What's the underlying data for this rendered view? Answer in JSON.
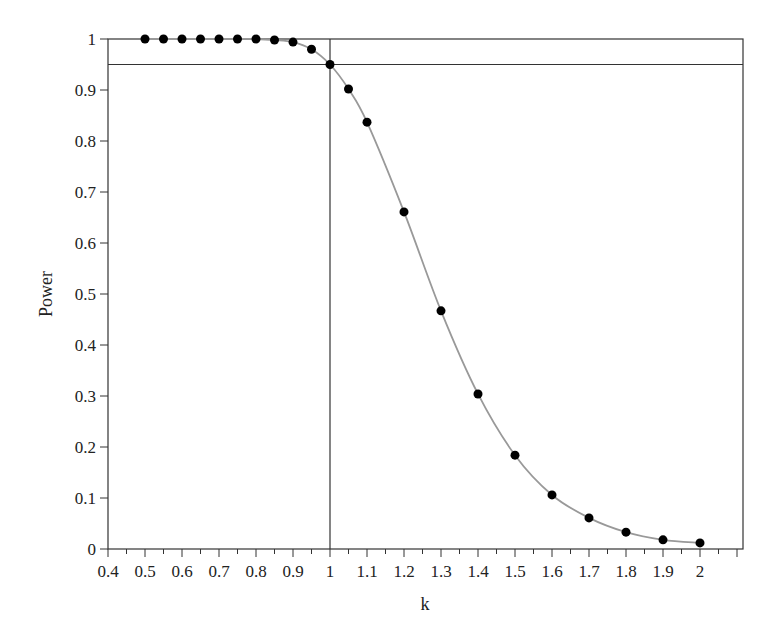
{
  "chart_data": {
    "type": "line",
    "title": "",
    "xlabel": "k",
    "ylabel": "Power",
    "xlim": [
      0.4,
      2.1
    ],
    "ylim": [
      0,
      1
    ],
    "grid": false,
    "legend": null,
    "x_ticks": [
      "0.4",
      "0.5",
      "0.6",
      "0.7",
      "0.8",
      "0.9",
      "1",
      "1.1",
      "1.2",
      "1.3",
      "1.4",
      "1.5",
      "1.6",
      "1.7",
      "1.8",
      "1.9",
      "2"
    ],
    "y_ticks": [
      "0",
      "0.1",
      "0.2",
      "0.3",
      "0.4",
      "0.5",
      "0.6",
      "0.7",
      "0.8",
      "0.9",
      "1"
    ],
    "reference_lines": {
      "horizontal": 0.95,
      "vertical": 1.0
    },
    "series": [
      {
        "name": "Power curve",
        "markers": true,
        "line_color": "#999999",
        "marker_color": "#000000",
        "x": [
          0.5,
          0.55,
          0.6,
          0.65,
          0.7,
          0.75,
          0.8,
          0.85,
          0.9,
          0.95,
          1.0,
          1.05,
          1.1,
          1.2,
          1.3,
          1.4,
          1.5,
          1.6,
          1.7,
          1.8,
          1.9,
          2.0
        ],
        "values": [
          1.0,
          1.0,
          1.0,
          1.0,
          1.0,
          1.0,
          1.0,
          0.998,
          0.994,
          0.98,
          0.95,
          0.902,
          0.837,
          0.661,
          0.467,
          0.304,
          0.184,
          0.106,
          0.061,
          0.033,
          0.018,
          0.012
        ]
      }
    ]
  }
}
